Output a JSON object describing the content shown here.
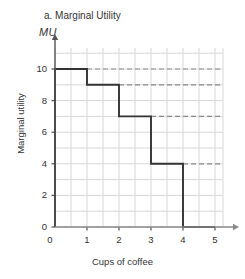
{
  "chart_data": {
    "type": "bar",
    "title": "a. Marginal Utility",
    "axis_symbol": "MU",
    "xlabel": "Cups of coffee",
    "ylabel": "Marginal utility",
    "categories": [
      "1",
      "2",
      "3",
      "4",
      "5"
    ],
    "values": [
      10,
      9,
      7,
      4,
      0
    ],
    "x": [
      0,
      1,
      2,
      3,
      4,
      5
    ],
    "xlim": [
      0,
      5
    ],
    "ylim": [
      0,
      11
    ],
    "xticks": [
      "0",
      "1",
      "2",
      "3",
      "4",
      "5"
    ],
    "yticks": [
      "0",
      "2",
      "4",
      "6",
      "8",
      "10"
    ],
    "grid": true,
    "grid_step_x": 0.5,
    "grid_step_y": 1,
    "legend": "none",
    "style": "step-bars",
    "reference_lines": [
      {
        "value": 10,
        "style": "dashed"
      },
      {
        "value": 9,
        "style": "dashed"
      },
      {
        "value": 7,
        "style": "dashed"
      },
      {
        "value": 4,
        "style": "dashed"
      }
    ],
    "colors": {
      "step_line": "#333333",
      "gridline": "#d8d8d8",
      "axis": "#555555",
      "dashed_line": "#8a8a8a",
      "background": "#ffffff"
    }
  }
}
